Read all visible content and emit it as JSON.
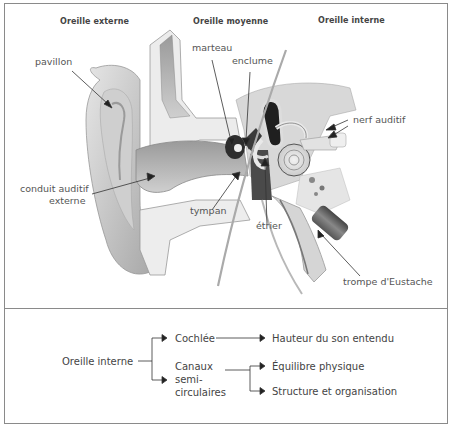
{
  "diagram": {
    "section_headers": [
      "Oreille externe",
      "Oreille moyenne",
      "Oreille interne"
    ],
    "labels": {
      "pavillon": "pavillon",
      "marteau": "marteau",
      "enclume": "enclume",
      "nerf_auditif": "nerf auditif",
      "conduit_line1": "conduit auditif",
      "conduit_line2": "externe",
      "tympan": "tympan",
      "etrier": "étrier",
      "trompe": "trompe d'Eustache"
    },
    "colors": {
      "border": "#8a8a8a",
      "text": "#444444",
      "ear_shade": "#bdbdbd",
      "dark_tissue": "#3a3a3a"
    }
  },
  "flowchart": {
    "root": "Oreille interne",
    "branches": [
      {
        "label": "Cochlée",
        "outputs": [
          "Hauteur du son entendu"
        ]
      },
      {
        "label_lines": [
          "Canaux",
          "semi-",
          "circulaires"
        ],
        "outputs": [
          "Équilibre physique",
          "Structure et organisation"
        ]
      }
    ]
  }
}
